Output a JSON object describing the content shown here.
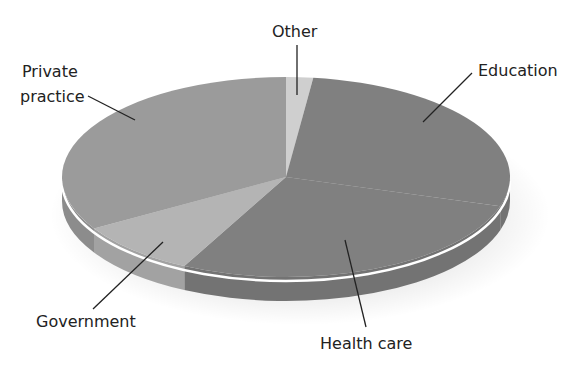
{
  "chart_data": {
    "type": "pie",
    "style": "3d-pie",
    "title": "",
    "legend": "none (direct leader-line labels)",
    "categories": [
      "Other",
      "Education",
      "Health care",
      "Government",
      "Private practice"
    ],
    "values": [
      2,
      28,
      28,
      9,
      33
    ],
    "units": "percent (estimated from slice angles)",
    "note": "Education and Health care share one fill color with no visible boundary; their split is estimated",
    "colors": {
      "Other": "#cfcfcf",
      "Education": "#808080",
      "Health care": "#808080",
      "Government": "#b4b4b4",
      "Private practice": "#9b9b9b"
    }
  },
  "geometry": {
    "cx": 286,
    "cy": 177,
    "rx": 224,
    "ry": 100,
    "depth": 24,
    "rim_color": "#ffffff",
    "side_shade": 0.9,
    "slices": [
      {
        "name": "Other",
        "start": -90,
        "end": -83,
        "color": "#cfcfcf"
      },
      {
        "name": "Education",
        "start": -83,
        "end": 17,
        "color": "#808080"
      },
      {
        "name": "Health care",
        "start": 17,
        "end": 117,
        "color": "#808080"
      },
      {
        "name": "Government",
        "start": 117,
        "end": 149,
        "color": "#b4b4b4"
      },
      {
        "name": "Private practice",
        "start": 149,
        "end": 270,
        "color": "#9b9b9b"
      }
    ]
  },
  "labels": {
    "other": {
      "text": "Other",
      "x": 272,
      "y": 22,
      "line": [
        297,
        45,
        297,
        95
      ]
    },
    "education": {
      "text": "Education",
      "x": 478,
      "y": 61,
      "line": [
        472,
        73,
        423,
        122
      ]
    },
    "private_line1": {
      "text": "Private",
      "x": 22,
      "y": 62
    },
    "private_line2": {
      "text": "practice",
      "x": 20,
      "y": 87,
      "line": [
        88,
        96,
        135,
        120
      ]
    },
    "government": {
      "text": "Government",
      "x": 36,
      "y": 312,
      "line": [
        93,
        309,
        163,
        242
      ]
    },
    "health_care": {
      "text": "Health care",
      "x": 320,
      "y": 334,
      "line": [
        366,
        327,
        345,
        240
      ]
    }
  }
}
